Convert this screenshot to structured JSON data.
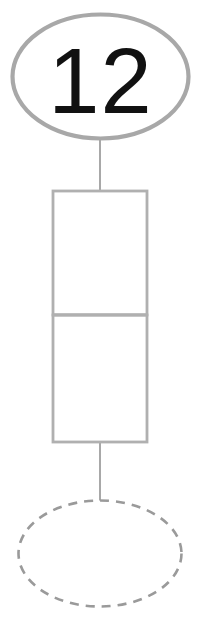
{
  "diagram": {
    "type": "node-link-diagram",
    "background_color": "#ffffff",
    "stroke_color_solid": "#a8a8a8",
    "stroke_color_dashed": "#9a9a9a",
    "text_color": "#111111",
    "nodes": [
      {
        "id": "top-ellipse",
        "shape": "ellipse",
        "label": "12",
        "stroke_style": "solid",
        "stroke_width": 4,
        "cx": 100.5,
        "cy": 76.5,
        "rx": 88,
        "ry": 62
      },
      {
        "id": "rectangle-stack",
        "shape": "rectangle",
        "label": "",
        "stroke_style": "solid",
        "stroke_width": 3,
        "x": 53,
        "y": 191,
        "width": 94,
        "height": 251,
        "divider_y": 315
      },
      {
        "id": "bottom-ellipse",
        "shape": "ellipse",
        "label": "",
        "stroke_style": "dashed",
        "stroke_width": 2.6,
        "cx": 100,
        "cy": 553.5,
        "rx": 81,
        "ry": 53
      }
    ],
    "edges": [
      {
        "id": "edge-ellipse-to-rect",
        "from": "top-ellipse",
        "to": "rectangle-stack",
        "x": 100,
        "y1": 139,
        "y2": 191,
        "stroke_width": 2
      },
      {
        "id": "edge-rect-to-ellipse",
        "from": "rectangle-stack",
        "to": "bottom-ellipse",
        "x": 100,
        "y1": 442,
        "y2": 501,
        "stroke_width": 2
      }
    ]
  },
  "labels": {
    "top_node_value": "12"
  }
}
